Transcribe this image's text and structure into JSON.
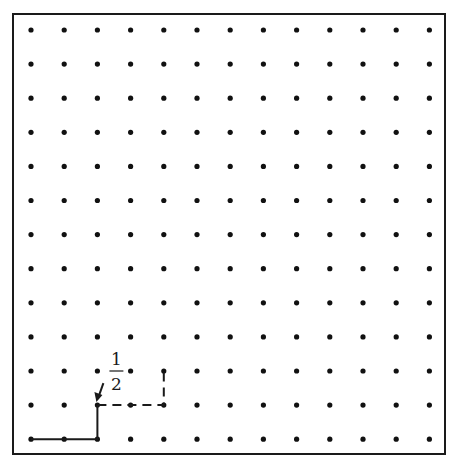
{
  "diagram": {
    "type": "lattice-grid",
    "columns": 13,
    "rows": 13,
    "frame": {
      "x1": 13,
      "y1": 14,
      "x2": 445,
      "y2": 454,
      "color": "#1a1a1a"
    },
    "origin": {
      "x": 31,
      "y": 30
    },
    "spacing": {
      "x": 33.2,
      "y": 34.1
    },
    "dot_color": "#111111",
    "dot_radius": 2.6,
    "solid_path": [
      [
        0,
        12
      ],
      [
        2,
        12
      ],
      [
        2,
        11
      ]
    ],
    "dashed_path": [
      [
        2,
        11
      ],
      [
        4,
        11
      ],
      [
        4,
        10
      ]
    ],
    "label": {
      "numerator": "1",
      "denominator": "2",
      "arrow_target": [
        2,
        11
      ]
    }
  }
}
